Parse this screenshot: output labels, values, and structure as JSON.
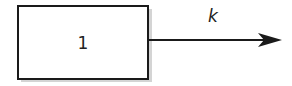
{
  "diagram": {
    "type": "compartment-model",
    "compartments": [
      {
        "id": "1",
        "label": "1"
      }
    ],
    "flows": [
      {
        "from": "1",
        "to": "out",
        "label": "k"
      }
    ]
  }
}
